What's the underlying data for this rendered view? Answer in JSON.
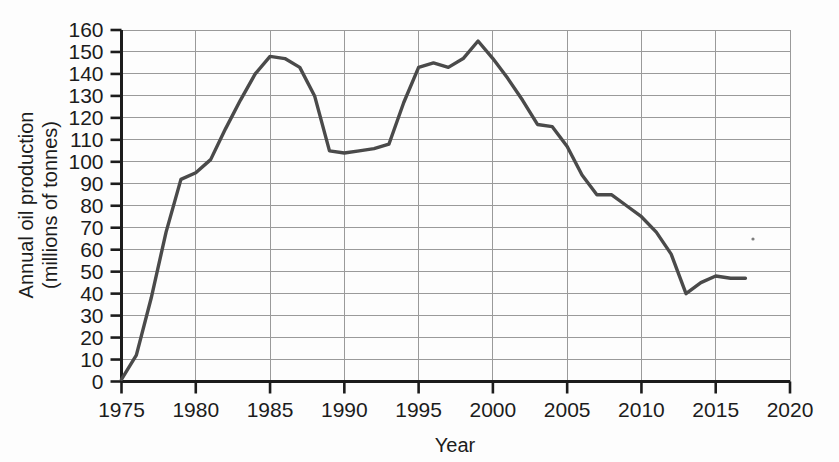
{
  "chart_data": {
    "type": "line",
    "title": "",
    "subtitle": "",
    "xlabel": "Year",
    "ylabel": "Annual oil production\n(millions of tonnes)",
    "ylabel_line1": "Annual oil production",
    "ylabel_line2": "(millions of tonnes)",
    "xlim": [
      1975,
      2020
    ],
    "ylim": [
      0,
      160
    ],
    "grid": true,
    "legend": false,
    "legend_position": "none",
    "line_color": "#4a4a4a",
    "grid_color": "#9a9a9a",
    "axis_color": "#1c1c1c",
    "xticks": [
      1975,
      1980,
      1985,
      1990,
      1995,
      2000,
      2005,
      2010,
      2015,
      2020
    ],
    "xtick_labels": [
      "1975",
      "1980",
      "1985",
      "1990",
      "1995",
      "2000",
      "2005",
      "2010",
      "2015",
      "2020"
    ],
    "yticks": [
      0,
      10,
      20,
      30,
      40,
      50,
      60,
      70,
      80,
      90,
      100,
      110,
      120,
      130,
      140,
      150,
      160
    ],
    "ytick_labels": [
      "0",
      "10",
      "20",
      "30",
      "40",
      "50",
      "60",
      "70",
      "80",
      "90",
      "100",
      "110",
      "120",
      "130",
      "140",
      "150",
      "160"
    ],
    "x": [
      1975,
      1976,
      1977,
      1978,
      1979,
      1980,
      1981,
      1982,
      1983,
      1984,
      1985,
      1986,
      1987,
      1988,
      1989,
      1990,
      1991,
      1992,
      1993,
      1994,
      1995,
      1996,
      1997,
      1998,
      1999,
      2000,
      2001,
      2002,
      2003,
      2004,
      2005,
      2006,
      2007,
      2008,
      2009,
      2010,
      2011,
      2012,
      2013,
      2014,
      2015,
      2016,
      2017
    ],
    "y": [
      1,
      12,
      38,
      68,
      92,
      95,
      101,
      115,
      128,
      140,
      148,
      147,
      143,
      130,
      105,
      104,
      105,
      106,
      108,
      127,
      143,
      145,
      143,
      147,
      155,
      147,
      138,
      128,
      117,
      116,
      107,
      94,
      85,
      85,
      80,
      75,
      68,
      58,
      40,
      45,
      48,
      47,
      47
    ],
    "series": [
      {
        "name": "Annual oil production",
        "color": "#4a4a4a",
        "values": [
          1,
          12,
          38,
          68,
          92,
          95,
          101,
          115,
          128,
          140,
          148,
          147,
          143,
          130,
          105,
          104,
          105,
          106,
          108,
          127,
          143,
          145,
          143,
          147,
          155,
          147,
          138,
          128,
          117,
          116,
          107,
          94,
          85,
          85,
          80,
          75,
          68,
          58,
          40,
          45,
          48,
          47,
          47
        ]
      }
    ],
    "annotations": []
  }
}
